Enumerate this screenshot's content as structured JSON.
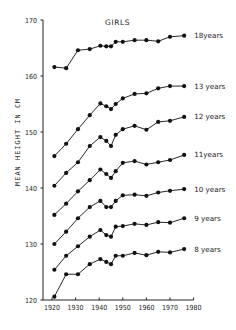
{
  "chart_data": {
    "type": "line",
    "title": "GIRLS",
    "xlabel": "",
    "ylabel": "MEAN HEIGHT IN CM",
    "xlim": [
      1918,
      1980
    ],
    "ylim": [
      120,
      170
    ],
    "grid": false,
    "legend_position": "inline-right",
    "x_ticks": [
      1920,
      1930,
      1940,
      1950,
      1960,
      1970,
      1980
    ],
    "y_ticks": [
      120,
      130,
      140,
      150,
      160,
      170
    ],
    "x": [
      1921,
      1926,
      1931,
      1936,
      1940.5,
      1943,
      1945,
      1947,
      1950,
      1955,
      1960,
      1965,
      1970,
      1976
    ],
    "series": [
      {
        "name": "18 years",
        "label": "18years",
        "values": [
          161.6,
          161.4,
          164.6,
          164.8,
          165.4,
          165.3,
          165.3,
          166.1,
          166.1,
          166.4,
          166.4,
          166.2,
          167.0,
          167.2
        ]
      },
      {
        "name": "13 years",
        "label": "13 years",
        "values": [
          145.7,
          147.9,
          150.5,
          153.0,
          155.1,
          154.6,
          154.1,
          155.0,
          156.0,
          156.8,
          156.9,
          157.8,
          158.2,
          158.2
        ]
      },
      {
        "name": "12 years",
        "label": "12 years",
        "values": [
          140.4,
          142.7,
          144.6,
          147.5,
          149.1,
          148.4,
          147.5,
          149.5,
          150.5,
          151.1,
          150.4,
          151.8,
          152.0,
          152.7
        ]
      },
      {
        "name": "11 years",
        "label": "11years",
        "values": [
          135.2,
          137.2,
          139.4,
          141.4,
          143.3,
          142.5,
          141.8,
          143.0,
          144.5,
          144.8,
          144.2,
          144.6,
          145.0,
          145.9
        ]
      },
      {
        "name": "10 years",
        "label": "10 years",
        "values": [
          130.0,
          132.2,
          134.6,
          136.6,
          137.7,
          136.6,
          136.6,
          137.7,
          138.7,
          138.8,
          138.6,
          139.2,
          139.5,
          139.8
        ]
      },
      {
        "name": "9 years",
        "label": "9 years",
        "values": [
          125.4,
          127.9,
          129.6,
          131.3,
          132.5,
          131.6,
          131.3,
          133.1,
          133.2,
          133.6,
          133.4,
          133.9,
          133.8,
          134.6
        ]
      },
      {
        "name": "8 years",
        "label": "8 years",
        "values": [
          120.6,
          124.6,
          124.6,
          126.4,
          127.3,
          126.8,
          126.4,
          127.9,
          127.9,
          128.4,
          128.0,
          128.6,
          128.5,
          129.1
        ]
      }
    ]
  },
  "labels": {
    "title": "GIRLS",
    "ylabel": "MEAN HEIGHT IN CM"
  }
}
